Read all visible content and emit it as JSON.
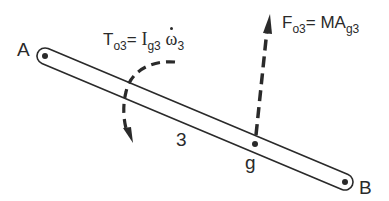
{
  "diagram": {
    "type": "free-body-diagram",
    "link": {
      "number_label": "3",
      "end_a_label": "A",
      "end_b_label": "B",
      "center_of_gravity_label": "g"
    },
    "torque": {
      "symbol": "T",
      "symbol_sub": "o3",
      "equals": "=",
      "inertia": "I",
      "inertia_sub": "g3",
      "omega": "ω",
      "omega_sub": "3"
    },
    "force": {
      "symbol": "F",
      "symbol_sub": "o3",
      "equals": "=",
      "rhs": "MA",
      "rhs_sub": "g3"
    },
    "colors": {
      "line": "#2a2a2a",
      "background": "#ffffff"
    }
  }
}
